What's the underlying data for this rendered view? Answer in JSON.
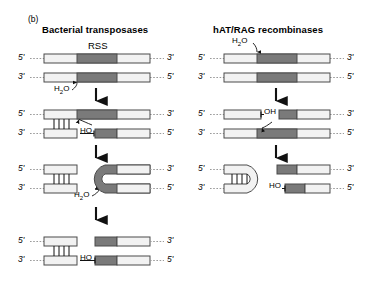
{
  "figure": {
    "letter": "(b)",
    "rss_label": "RSS"
  },
  "panels": [
    {
      "id": "bacterial",
      "title": "Bacterial transposases",
      "stages": [
        {
          "id": "b-stage1",
          "name": "intact-duplex",
          "top_end_left": "5'",
          "top_end_right": "3'",
          "bottom_end_left": "3'",
          "bottom_end_right": "5'",
          "annotations": [
            "H2O"
          ]
        },
        {
          "id": "b-stage2",
          "name": "nicked-duplex",
          "top_end_left": "5'",
          "top_end_right": "3'",
          "bottom_end_left": "3'",
          "bottom_end_right": "5'",
          "annotations": [
            "HO-"
          ]
        },
        {
          "id": "b-stage3",
          "name": "hairpin-intermediate",
          "top_end_left": "5'",
          "top_end_right": "3'",
          "bottom_end_left": "3'",
          "bottom_end_right": "5'",
          "annotations": [
            "H2O"
          ]
        },
        {
          "id": "b-stage4",
          "name": "resolved-products",
          "top_end_left": "5'",
          "top_end_right": "3'",
          "bottom_end_left": "3'",
          "bottom_end_right": "5'",
          "annotations": [
            "HO-"
          ]
        }
      ]
    },
    {
      "id": "hat-rag",
      "title": "hAT/RAG recombinases",
      "stages": [
        {
          "id": "r-stage1",
          "name": "intact-duplex",
          "top_end_left": "5'",
          "top_end_right": "3'",
          "bottom_end_left": "3'",
          "bottom_end_right": "5'",
          "annotations": [
            "H2O"
          ]
        },
        {
          "id": "r-stage2",
          "name": "nicked-duplex",
          "top_end_left": "5'",
          "top_end_right": "3'",
          "bottom_end_left": "3'",
          "bottom_end_right": "5'",
          "annotations": [
            "-OH"
          ]
        },
        {
          "id": "r-stage3",
          "name": "hairpin-products",
          "top_end_left": "5'",
          "top_end_right": "3'",
          "bottom_end_left": "3'",
          "bottom_end_right": "5'",
          "annotations": [
            "HO-"
          ]
        }
      ]
    }
  ],
  "labels": {
    "water": "H",
    "water_sub": "2",
    "water_end": "O",
    "ho": "HO",
    "oh": "OH",
    "five_prime": "5'",
    "three_prime": "3'"
  },
  "colors": {
    "rss_fill": "#7a7a7a",
    "strand_fill": "#f2f2f2",
    "strand_stroke": "#4a4a4a",
    "dotted": "#9a9a9a",
    "arrow": "#111111",
    "text": "#000000",
    "background": "#ffffff"
  }
}
